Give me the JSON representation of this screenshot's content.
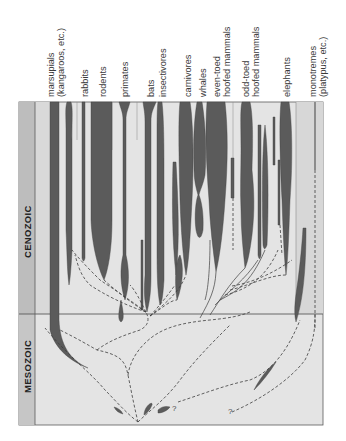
{
  "figure": {
    "eras": [
      {
        "label": "CENOZOIC"
      },
      {
        "label": "MESOZOIC"
      }
    ],
    "groups": [
      {
        "line1": "marsupials",
        "line2": "(kangaroos, etc.)"
      },
      {
        "line1": "rabbits",
        "line2": ""
      },
      {
        "line1": "rodents",
        "line2": ""
      },
      {
        "line1": "primates",
        "line2": ""
      },
      {
        "line1": "bats",
        "line2": ""
      },
      {
        "line1": "insectivores",
        "line2": ""
      },
      {
        "line1": "carnivores",
        "line2": ""
      },
      {
        "line1": "whales",
        "line2": ""
      },
      {
        "line1": "even-toed",
        "line2": "hoofed mammals"
      },
      {
        "line1": "odd-toed",
        "line2": "hoofed mammals"
      },
      {
        "line1": "elephants",
        "line2": ""
      },
      {
        "line1": "monotremes",
        "line2": "(platypus, etc.)"
      }
    ],
    "uncertain_marks": [
      "?",
      "?"
    ],
    "colors": {
      "background": "#e4e4e4",
      "era_band_cenozoic": "#bdbdbd",
      "era_band_mesozoic": "#c6c6c6",
      "lineage_fill": "#5b5b5b",
      "frame_line": "#5a5a5a",
      "column_light": "#d9d9d9"
    }
  }
}
